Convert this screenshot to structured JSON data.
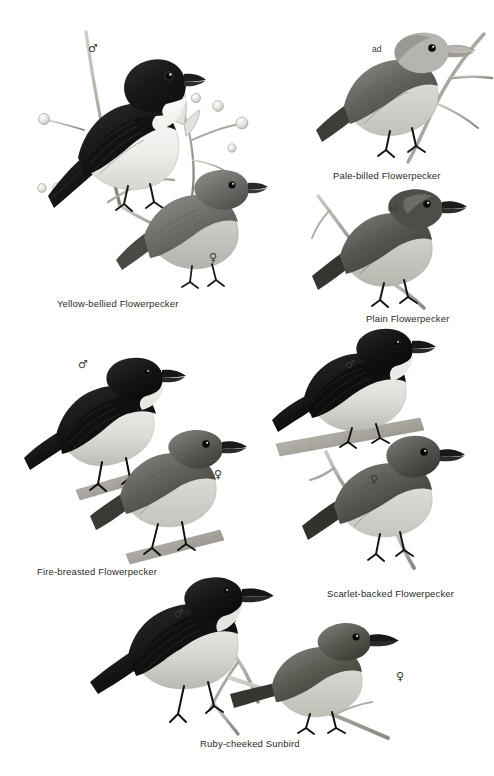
{
  "plate": {
    "width": 494,
    "height": 776,
    "background_color": "#ffffff",
    "ink_color": "#2b2b2b",
    "style": "grayscale field-guide bird illustration plate"
  },
  "species": [
    {
      "id": "yellow-bellied-flowerpecker",
      "caption": "Yellow-bellied Flowerpecker",
      "caption_x": 57,
      "caption_y": 298,
      "marks": [
        {
          "symbol": "♂",
          "type": "male",
          "x": 88,
          "y": 43
        },
        {
          "symbol": "♀",
          "type": "female",
          "x": 209,
          "y": 252
        }
      ]
    },
    {
      "id": "pale-billed-flowerpecker",
      "caption": "Pale-billed Flowerpecker",
      "caption_x": 333,
      "caption_y": 170,
      "marks": [
        {
          "symbol": "ad",
          "type": "adult",
          "x": 372,
          "y": 45
        }
      ]
    },
    {
      "id": "plain-flowerpecker",
      "caption": "Plain Flowerpecker",
      "caption_x": 366,
      "caption_y": 313,
      "marks": [
        {
          "symbol": "ad",
          "type": "adult",
          "x": 388,
          "y": 204
        }
      ]
    },
    {
      "id": "fire-breasted-flowerpecker",
      "caption": "Fire-breasted Flowerpecker",
      "caption_x": 37,
      "caption_y": 566,
      "marks": [
        {
          "symbol": "♂",
          "type": "male",
          "x": 78,
          "y": 359
        },
        {
          "symbol": "♀",
          "type": "female",
          "x": 214,
          "y": 469
        }
      ]
    },
    {
      "id": "scarlet-backed-flowerpecker",
      "caption": "Scarlet-backed Flowerpecker",
      "caption_x": 327,
      "caption_y": 588,
      "marks": [
        {
          "symbol": "♂",
          "type": "male",
          "x": 345,
          "y": 359
        },
        {
          "symbol": "♀",
          "type": "female",
          "x": 370,
          "y": 474
        }
      ]
    },
    {
      "id": "ruby-cheeked-sunbird",
      "caption": "Ruby-cheeked Sunbird",
      "caption_x": 200,
      "caption_y": 738,
      "marks": [
        {
          "symbol": "♂",
          "type": "male",
          "x": 174,
          "y": 608
        },
        {
          "symbol": "♀",
          "type": "female",
          "x": 396,
          "y": 671
        }
      ]
    }
  ]
}
